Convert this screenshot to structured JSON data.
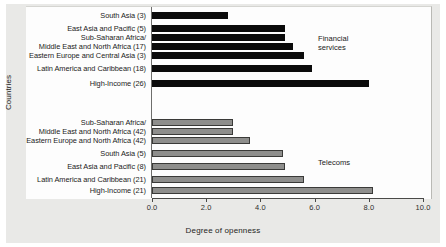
{
  "chart_data": {
    "type": "bar",
    "orientation": "horizontal",
    "title": "",
    "xlabel": "Degree of openness",
    "ylabel": "Countries",
    "xlim": [
      0.0,
      10.0
    ],
    "xticks": [
      "0.0",
      "2.0",
      "4.0",
      "6.0",
      "8.0",
      "10.0"
    ],
    "xtick_values": [
      0.0,
      2.0,
      4.0,
      6.0,
      8.0,
      10.0
    ],
    "grid": false,
    "legend_position": "inside-right",
    "series": [
      {
        "name": "Financial services",
        "color": "#0b0b0b",
        "categories": [
          "South Asia (3)",
          "East Asia and Pacific (5)",
          "Sub-Saharan Africa/",
          "Middle East and North Africa (17)",
          "Eastern Europe and Central Asia (3)",
          "Latin America and Caribbean (18)",
          "High-Income (26)"
        ],
        "values": [
          2.8,
          4.9,
          4.9,
          5.2,
          5.6,
          5.9,
          8.0
        ]
      },
      {
        "name": "Telecoms",
        "color": "#8e8e8c",
        "categories": [
          "Sub-Saharan Africa/",
          "Middle East and North Africa (42)",
          "Eastern Europe and North Africa (42)",
          "South Asia (5)",
          "East Asia and Pacific (8)",
          "Latin America and Caribbean (21)",
          "High-Income (21)"
        ],
        "values": [
          3.0,
          3.0,
          3.6,
          4.85,
          4.9,
          5.6,
          8.15
        ]
      }
    ],
    "annotations": [
      {
        "name": "Financial services",
        "lines": [
          "Financial",
          "services"
        ]
      },
      {
        "name": "Telecoms",
        "lines": [
          "Telecoms"
        ]
      }
    ]
  },
  "axis": {
    "x_label": "Degree of openness",
    "y_label": "Countries",
    "ticks": [
      {
        "value": 0.0,
        "label": "0.0"
      },
      {
        "value": 2.0,
        "label": "2.0"
      },
      {
        "value": 4.0,
        "label": "4.0"
      },
      {
        "value": 6.0,
        "label": "6.0"
      },
      {
        "value": 8.0,
        "label": "8.0"
      },
      {
        "value": 10.0,
        "label": "10.0"
      }
    ]
  },
  "groups": {
    "financial": {
      "annotation_line1": "Financial",
      "annotation_line2": "services",
      "rows": [
        {
          "label": "South Asia (3)",
          "value": 2.8
        },
        {
          "label": "East Asia and Pacific (5)",
          "value": 4.9
        },
        {
          "label": "Sub-Saharan Africa/",
          "value": 4.9
        },
        {
          "label": "Middle East and North Africa (17)",
          "value": 5.2
        },
        {
          "label": "Eastern Europe and Central Asia (3)",
          "value": 5.6
        },
        {
          "label": "Latin America and Caribbean (18)",
          "value": 5.9
        },
        {
          "label": "High-Income (26)",
          "value": 8.0
        }
      ]
    },
    "telecom": {
      "annotation_line1": "Telecoms",
      "rows": [
        {
          "label": "Sub-Saharan Africa/",
          "value": 3.0
        },
        {
          "label": "Middle East and North Africa (42)",
          "value": 3.0
        },
        {
          "label": "Eastern Europe and North Africa (42)",
          "value": 3.6
        },
        {
          "label": "South Asia (5)",
          "value": 4.85
        },
        {
          "label": "East Asia and Pacific (8)",
          "value": 4.9
        },
        {
          "label": "Latin America and Caribbean (21)",
          "value": 5.6
        },
        {
          "label": "High-Income (21)",
          "value": 8.15
        }
      ]
    }
  },
  "colors": {
    "financial_bar": "#0b0b0b",
    "telecom_bar": "#8e8e8c",
    "plate_background": "#e9e9e7",
    "panel_background": "#fdfdfd",
    "axis": "#4a4a48"
  }
}
